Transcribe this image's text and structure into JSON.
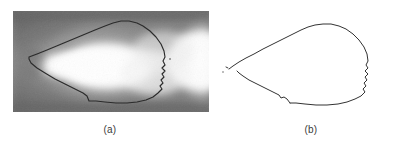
{
  "figure": {
    "kind": "two-panel-image-figure",
    "background_color": "#ffffff",
    "panels": [
      {
        "id": "a",
        "caption": "(a)",
        "type": "grayscale-image-with-contour-overlay",
        "description": "Grayscale thermal-style image of a bright plume with a traced dark boundary contour overlaid",
        "image_background_color": "#8a8a8a",
        "bright_region_color": "#ffffff",
        "contour_color": "#2b2b2b",
        "contour_width_px": 1.1
      },
      {
        "id": "b",
        "caption": "(b)",
        "type": "extracted-contour",
        "description": "The boundary contour extracted from panel (a), drawn alone on a white background",
        "background_color": "#ffffff",
        "contour_color": "#333333",
        "contour_width_px": 1.0
      }
    ]
  },
  "captions": {
    "a": "(a)",
    "b": "(b)"
  },
  "colors": {
    "page_background": "#ffffff",
    "image_mid_gray": "#8a8a8a",
    "image_dark_gray": "#5e5e5e",
    "image_light_gray": "#c9c9c9",
    "image_white": "#ffffff",
    "contour_dark": "#2b2b2b",
    "caption_text": "#3a3a3a"
  }
}
